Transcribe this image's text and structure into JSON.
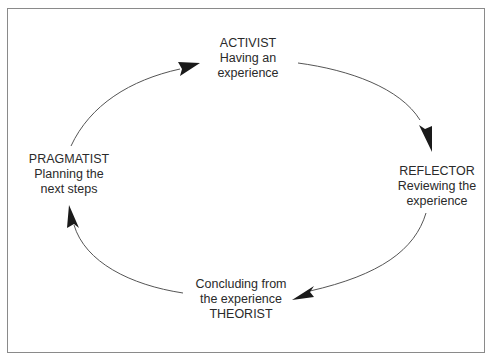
{
  "diagram": {
    "type": "cycle",
    "title": "",
    "stages": [
      {
        "id": "activist",
        "role": "ACTIVIST",
        "description_line1": "Having an",
        "description_line2": "experience",
        "position": "top"
      },
      {
        "id": "reflector",
        "role": "REFLECTOR",
        "description_line1": "Reviewing the",
        "description_line2": "experience",
        "position": "right"
      },
      {
        "id": "theorist",
        "role": "THEORIST",
        "description_line1": "Concluding from",
        "description_line2": "the experience",
        "position": "bottom"
      },
      {
        "id": "pragmatist",
        "role": "PRAGMATIST",
        "description_line1": "Planning the",
        "description_line2": "next steps",
        "position": "left"
      }
    ],
    "flow": [
      {
        "from": "pragmatist",
        "to": "activist"
      },
      {
        "from": "activist",
        "to": "reflector"
      },
      {
        "from": "reflector",
        "to": "theorist"
      },
      {
        "from": "theorist",
        "to": "pragmatist"
      }
    ],
    "direction": "clockwise",
    "colors": {
      "stroke": "#555555",
      "arrowhead": "#1a1a1a",
      "frame": "#8a8a8a",
      "text": "#2a2a2a"
    }
  }
}
